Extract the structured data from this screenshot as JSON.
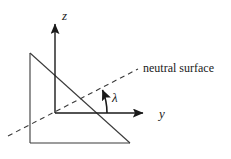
{
  "figure": {
    "background_color": "#ffffff",
    "stroke_color": "#3a3a3a",
    "text_color": "#1a1a1a",
    "width": 231,
    "height": 159
  },
  "axes": {
    "z_label": "z",
    "y_label": "y"
  },
  "angle": {
    "symbol": "λ"
  },
  "annotations": {
    "neutral_surface": "neutral surface"
  },
  "geometry": {
    "origin": {
      "x": 55,
      "y": 113
    },
    "z_axis": {
      "x1": 55,
      "y1": 113,
      "x2": 55,
      "y2": 22
    },
    "y_axis": {
      "x1": 55,
      "y1": 113,
      "x2": 146,
      "y2": 113
    },
    "triangle": {
      "apex_top_left": {
        "x": 30,
        "y": 53
      },
      "corner_bottom_left": {
        "x": 30,
        "y": 143
      },
      "corner_bottom_right": {
        "x": 130,
        "y": 143
      }
    },
    "neutral_line": {
      "x1": 8,
      "y1": 136,
      "x2": 138,
      "y2": 69
    },
    "angle_arc": {
      "vertex_x": 105,
      "vertex_y": 113,
      "tip_x": 101,
      "tip_y": 87
    }
  }
}
